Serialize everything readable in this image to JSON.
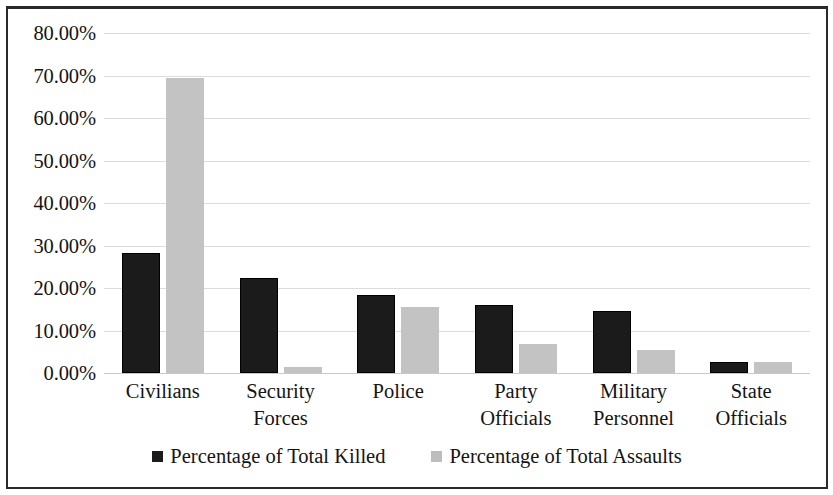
{
  "chart_data": {
    "type": "bar",
    "title": "",
    "xlabel": "",
    "ylabel": "",
    "ylim": [
      0,
      80
    ],
    "grid": true,
    "legend_position": "bottom",
    "y_tick_labels": [
      "80.00%",
      "70.00%",
      "60.00%",
      "50.00%",
      "40.00%",
      "30.00%",
      "20.00%",
      "10.00%",
      "0.00%"
    ],
    "y_tick_values": [
      80,
      70,
      60,
      50,
      40,
      30,
      20,
      10,
      0
    ],
    "categories": [
      "Civilians",
      "Security Forces",
      "Police",
      "Party Officials",
      "Military Personnel",
      "State Officials"
    ],
    "category_lines": [
      [
        "Civilians"
      ],
      [
        "Security",
        "Forces"
      ],
      [
        "Police"
      ],
      [
        "Party",
        "Officials"
      ],
      [
        "Military",
        "Personnel"
      ],
      [
        "State",
        "Officials"
      ]
    ],
    "series": [
      {
        "name": "Percentage of Total Killed",
        "color": "#1b1b1b",
        "values": [
          28.3,
          22.3,
          18.4,
          16.0,
          14.6,
          2.5
        ]
      },
      {
        "name": "Percentage of Total Assaults",
        "color": "#c3c3c3",
        "values": [
          69.5,
          1.5,
          15.6,
          6.8,
          5.3,
          2.6
        ]
      }
    ]
  },
  "legend": {
    "items": [
      {
        "label": "Percentage of Total Killed",
        "swatch": "black-square-marker"
      },
      {
        "label": "Percentage of Total Assaults",
        "swatch": "gray-square-marker"
      }
    ]
  }
}
